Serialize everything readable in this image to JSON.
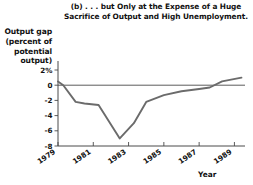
{
  "chart_data": {
    "type": "line",
    "title": "(b) . . . but Only at the Expense of a Huge Sacrifice of Output and High Unemployment.",
    "title_line1": "(b) . . . but Only at the Expense of a Huge",
    "title_line2": "Sacrifice of Output and High Unemployment.",
    "xlabel": "Year",
    "ylabel": "Output gap (percent of potential output)",
    "ylabel_line1": "Output gap",
    "ylabel_line2": "(percent of",
    "ylabel_line3": "potential",
    "ylabel_line4": "output)",
    "xlim": [
      1979,
      1989.6
    ],
    "ylim": [
      -8,
      3
    ],
    "yticks": [
      2,
      0,
      -2,
      -4,
      -6,
      -8
    ],
    "ytick_labels": [
      "2%",
      "0",
      "-2",
      "-4",
      "-6",
      "-8"
    ],
    "xticks": [
      1979,
      1981,
      1983,
      1985,
      1987,
      1989
    ],
    "xtick_labels": [
      "1979",
      "1981",
      "1983",
      "1985",
      "1987",
      "1989"
    ],
    "grid": false,
    "legend": null,
    "zero_reference_line": 0,
    "series": [
      {
        "name": "Output gap",
        "color": "#6b6b6b",
        "x": [
          1979.0,
          1979.3,
          1980.0,
          1980.5,
          1981.3,
          1982.5,
          1983.3,
          1984.0,
          1985.0,
          1986.0,
          1987.0,
          1987.6,
          1988.3,
          1989.4
        ],
        "values": [
          0.5,
          0.0,
          -2.2,
          -2.4,
          -2.6,
          -7.0,
          -5.0,
          -2.2,
          -1.3,
          -0.8,
          -0.5,
          -0.3,
          0.5,
          1.0
        ]
      }
    ]
  },
  "colors": {
    "line": "#6b6b6b",
    "axis": "#4a4a4a",
    "background": "#ffffff",
    "text": "#111111"
  }
}
